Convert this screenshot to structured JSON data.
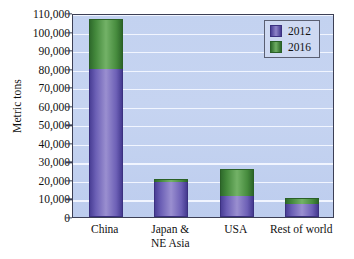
{
  "chart_data": {
    "type": "bar",
    "title": "",
    "xlabel": "",
    "ylabel": "Metric tons",
    "ylim": [
      0,
      110000
    ],
    "ytick_labels": [
      "110,000",
      "100,000",
      "90,000",
      "80,000",
      "70,000",
      "60,000",
      "50,000",
      "40,000",
      "30,000",
      "20,000",
      "10,000",
      "0"
    ],
    "ytick_values": [
      110000,
      100000,
      90000,
      80000,
      70000,
      60000,
      50000,
      40000,
      30000,
      20000,
      10000,
      0
    ],
    "grid": true,
    "stacked": true,
    "legend_position": "top-right",
    "categories": [
      "China",
      "Japan &\nNE Asia",
      "USA",
      "Rest of world"
    ],
    "category_labels": [
      {
        "line1": "China",
        "line2": ""
      },
      {
        "line1": "Japan &",
        "line2": "NE Asia"
      },
      {
        "line1": "USA",
        "line2": ""
      },
      {
        "line1": "Rest of world",
        "line2": ""
      }
    ],
    "series": [
      {
        "name": "2012",
        "color": "#6d60b6",
        "values": [
          80000,
          19000,
          11500,
          7000
        ]
      },
      {
        "name": "2016",
        "color": "#4a8c3f",
        "values": [
          27000,
          1300,
          14200,
          3400
        ]
      }
    ],
    "totals": [
      107000,
      20300,
      25700,
      10400
    ]
  },
  "legend": {
    "entries": [
      {
        "label": "2012"
      },
      {
        "label": "2016"
      }
    ]
  },
  "colors": {
    "plot_background": "#c3d2f0",
    "gridline": "#f3f7ff",
    "frame": "#3c3f55",
    "series_2012": "#6d60b6",
    "series_2016": "#4a8c3f",
    "text": "#111111"
  }
}
